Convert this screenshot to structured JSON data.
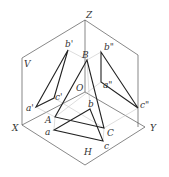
{
  "labels": {
    "Z": "Z",
    "V": "V",
    "X": "X",
    "Y": "Y",
    "H": "H",
    "O": "O",
    "A": "A",
    "B": "B",
    "C": "C",
    "a": "a",
    "b": "b",
    "c": "c",
    "a1": "a'",
    "b1": "b'",
    "c1": "c'",
    "a2": "a\"",
    "b2": "b\"",
    "c2": "c\""
  },
  "colors": {
    "line": "#333333",
    "thin": "#888888",
    "light": "#bbbbbb"
  }
}
